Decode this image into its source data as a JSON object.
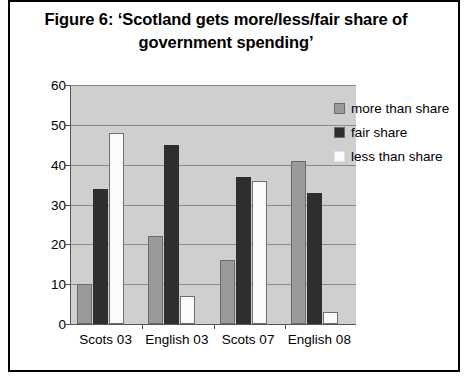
{
  "figure": {
    "title": "Figure 6: ‘Scotland gets more/less/fair share of government spending’"
  },
  "legend": {
    "position": "right",
    "entries": [
      {
        "label": "more than share",
        "color": "#9a9a9a"
      },
      {
        "label": "fair share",
        "color": "#2e2e2e"
      },
      {
        "label": "less than share",
        "color": "#fbfbfb"
      }
    ]
  },
  "axis": {
    "y_ticks": [
      "0",
      "10",
      "20",
      "30",
      "40",
      "50",
      "60"
    ]
  },
  "chart_data": {
    "type": "bar",
    "title": "Figure 6: ‘Scotland gets more/less/fair share of government spending’",
    "categories": [
      "Scots 03",
      "English 03",
      "Scots 07",
      "English 08"
    ],
    "series": [
      {
        "name": "more than share",
        "values": [
          10,
          22,
          16,
          41
        ],
        "color": "#9a9a9a"
      },
      {
        "name": "fair share",
        "values": [
          34,
          45,
          37,
          33
        ],
        "color": "#2e2e2e"
      },
      {
        "name": "less than share",
        "values": [
          48,
          7,
          36,
          3
        ],
        "color": "#fbfbfb"
      }
    ],
    "xlabel": "",
    "ylabel": "",
    "ylim": [
      0,
      60
    ],
    "ytick_step": 10,
    "grid": true,
    "legend_position": "right"
  }
}
